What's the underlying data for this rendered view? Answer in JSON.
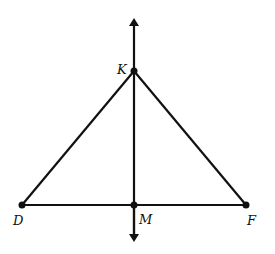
{
  "diagram": {
    "points": {
      "K": {
        "label": "K",
        "x": 134,
        "y": 71
      },
      "D": {
        "label": "D",
        "x": 22,
        "y": 205
      },
      "M": {
        "label": "M",
        "x": 134,
        "y": 205
      },
      "F": {
        "label": "F",
        "x": 246,
        "y": 205
      }
    },
    "line_color": "#111111"
  }
}
